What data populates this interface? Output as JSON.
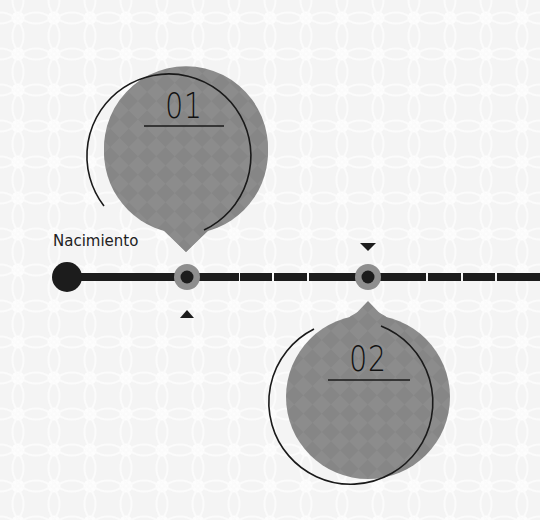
{
  "timeline": {
    "start_label": "Nacimiento",
    "colors": {
      "line": "#1c1c1c",
      "node_ring": "#8e8e8e",
      "node_core": "#1c1c1c",
      "bubble_fill": "#8c8c8c",
      "bubble_outline": "#1a1a1a",
      "background": "#f4f4f4"
    },
    "events": [
      {
        "number": "01",
        "position": "above"
      },
      {
        "number": "02",
        "position": "below"
      }
    ]
  }
}
